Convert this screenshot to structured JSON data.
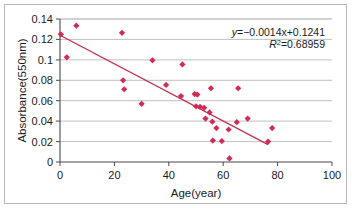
{
  "chart_data": {
    "type": "scatter",
    "title": "",
    "xlabel": "Age(year)",
    "ylabel": "Absorbance(550nm)",
    "xlim": [
      0,
      100
    ],
    "ylim": [
      0,
      0.14
    ],
    "xticks": [
      "0",
      "20",
      "40",
      "60",
      "80",
      "100"
    ],
    "yticks": [
      "0",
      "0.02",
      "0.04",
      "0.06",
      "0.08",
      "0.1",
      "0.12",
      "0.14"
    ],
    "xtick_values": [
      0,
      20,
      40,
      60,
      80,
      100
    ],
    "ytick_values": [
      0,
      0.02,
      0.04,
      0.06,
      0.08,
      0.1,
      0.12,
      0.14
    ],
    "grid": "horizontal",
    "legend": "none",
    "marker": "diamond",
    "marker_color": "#d12a55",
    "grid_color": "#b0b0b0",
    "axis_color": "#4a4a4a",
    "points": [
      {
        "x": 0.3,
        "y": 0.125
      },
      {
        "x": 2.5,
        "y": 0.1025
      },
      {
        "x": 6.0,
        "y": 0.1335
      },
      {
        "x": 22.8,
        "y": 0.1265
      },
      {
        "x": 23.2,
        "y": 0.08
      },
      {
        "x": 23.6,
        "y": 0.0712
      },
      {
        "x": 30.0,
        "y": 0.057
      },
      {
        "x": 34.0,
        "y": 0.0995
      },
      {
        "x": 39.0,
        "y": 0.0755
      },
      {
        "x": 44.5,
        "y": 0.0645
      },
      {
        "x": 45.0,
        "y": 0.0955
      },
      {
        "x": 49.5,
        "y": 0.0665
      },
      {
        "x": 50.5,
        "y": 0.066
      },
      {
        "x": 50.0,
        "y": 0.0545
      },
      {
        "x": 51.5,
        "y": 0.054
      },
      {
        "x": 53.0,
        "y": 0.053
      },
      {
        "x": 53.5,
        "y": 0.0425
      },
      {
        "x": 55.0,
        "y": 0.0485
      },
      {
        "x": 55.5,
        "y": 0.0722
      },
      {
        "x": 56.0,
        "y": 0.0395
      },
      {
        "x": 56.2,
        "y": 0.021
      },
      {
        "x": 57.5,
        "y": 0.0332
      },
      {
        "x": 59.5,
        "y": 0.0205
      },
      {
        "x": 62.0,
        "y": 0.0318
      },
      {
        "x": 62.3,
        "y": 0.0035
      },
      {
        "x": 65.0,
        "y": 0.039
      },
      {
        "x": 65.5,
        "y": 0.0722
      },
      {
        "x": 69.0,
        "y": 0.0425
      },
      {
        "x": 76.5,
        "y": 0.02
      },
      {
        "x": 78.0,
        "y": 0.0332
      }
    ],
    "trendline": {
      "slope": -0.0014,
      "intercept": 0.1241,
      "x_start": 0,
      "x_end": 76.5,
      "color": "#c0304f"
    },
    "annotations": {
      "equation_y": "y",
      "equation_body": "=−0.0014x+0.1241",
      "equation_full": "y=−0.0014x+0.1241",
      "r_symbol": "R",
      "r_exponent": "2",
      "r_value": "=0.68959",
      "r_squared_full": "R²=0.68959"
    }
  }
}
